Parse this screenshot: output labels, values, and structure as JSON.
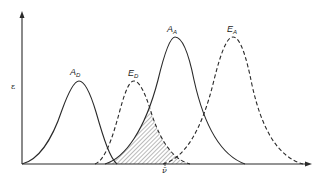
{
  "figure": {
    "y_axis_label": "ε",
    "x_axis_marker": "ν̄",
    "curves": [
      {
        "id": "AD",
        "main": "A",
        "sub": "D",
        "style": "solid",
        "peak_x": 79,
        "peak_y": 81
      },
      {
        "id": "ED",
        "main": "E",
        "sub": "D",
        "style": "dashed",
        "peak_x": 134,
        "peak_y": 81
      },
      {
        "id": "AA",
        "main": "A",
        "sub": "A",
        "style": "solid",
        "peak_x": 175,
        "peak_y": 37
      },
      {
        "id": "EA",
        "main": "E",
        "sub": "A",
        "style": "dashed",
        "peak_x": 233,
        "peak_y": 37
      }
    ],
    "shaded_region": "overlap of E_D and A_A",
    "colors": {
      "line": "#2a2a2a",
      "hatch": "#555555",
      "background": "#ffffff"
    }
  }
}
